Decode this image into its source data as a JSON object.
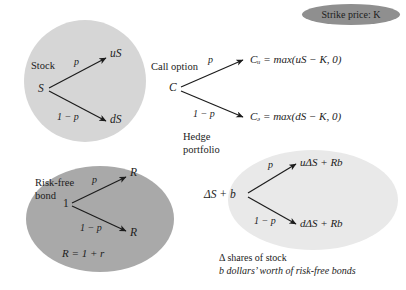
{
  "figure": {
    "strike_badge": {
      "text": "Strike price: K",
      "fill": "#8f8f8f"
    },
    "panels": {
      "stock": {
        "title": "Stock",
        "root": "S",
        "up_prob": "p",
        "down_prob": "1 − p",
        "up_node": "uS",
        "down_node": "dS",
        "fill": "#d6d6d6"
      },
      "call_option": {
        "title": "Call option",
        "root": "C",
        "up_prob": "p",
        "down_prob": "1 − p",
        "up_node": "Cᵤ = max(uS − K, 0)",
        "down_node": "Cₔ = max(dS − K, 0)",
        "fill": "none"
      },
      "risk_free_bond": {
        "title_line1": "Risk-free",
        "title_line2": "bond",
        "root": "1",
        "up_prob": "p",
        "down_prob": "1 − p",
        "up_node": "R",
        "down_node": "R",
        "note": "R = 1 + r",
        "fill": "#a9a9a9"
      },
      "hedge_portfolio": {
        "title_line1": "Hedge",
        "title_line2": "portfolio",
        "root": "ΔS + b",
        "up_prob": "p",
        "down_prob": "1 − p",
        "up_node": "uΔS + Rb",
        "down_node": "dΔS + Rb",
        "caption_line1": "Δ shares of stock",
        "caption_line2": "b dollars’ worth of risk-free bonds",
        "fill": "#e9e9e9"
      }
    }
  }
}
